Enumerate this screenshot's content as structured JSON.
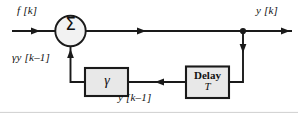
{
  "figure": {
    "type": "block-diagram",
    "background_color": "#ffffff",
    "line_color": "#1a1a1a",
    "box_fill_color": "#e8e8e8",
    "box_border_color": "#1a1a1a",
    "circle_fill_color": "#f2f2f2"
  },
  "labels": {
    "input_signal": "f [k]",
    "output_signal": "y [k]",
    "feedback_signal": "γy [k–1]",
    "delayed_signal": "y [k–1]"
  },
  "blocks": {
    "summer": {
      "symbol": "Σ",
      "name": "summing-junction"
    },
    "gain": {
      "label": "γ",
      "name": "gain-block"
    },
    "delay": {
      "label": "Delay",
      "sub_label": "T",
      "name": "delay-block"
    }
  },
  "connections": [
    {
      "from": "input",
      "to": "summer",
      "label": "f [k]"
    },
    {
      "from": "summer",
      "to": "output-junction",
      "label": ""
    },
    {
      "from": "output-junction",
      "to": "output",
      "label": "y [k]"
    },
    {
      "from": "output-junction",
      "to": "delay",
      "label": ""
    },
    {
      "from": "delay",
      "to": "gain",
      "label": "y [k–1]"
    },
    {
      "from": "gain",
      "to": "summer",
      "label": "γy [k–1]"
    }
  ]
}
